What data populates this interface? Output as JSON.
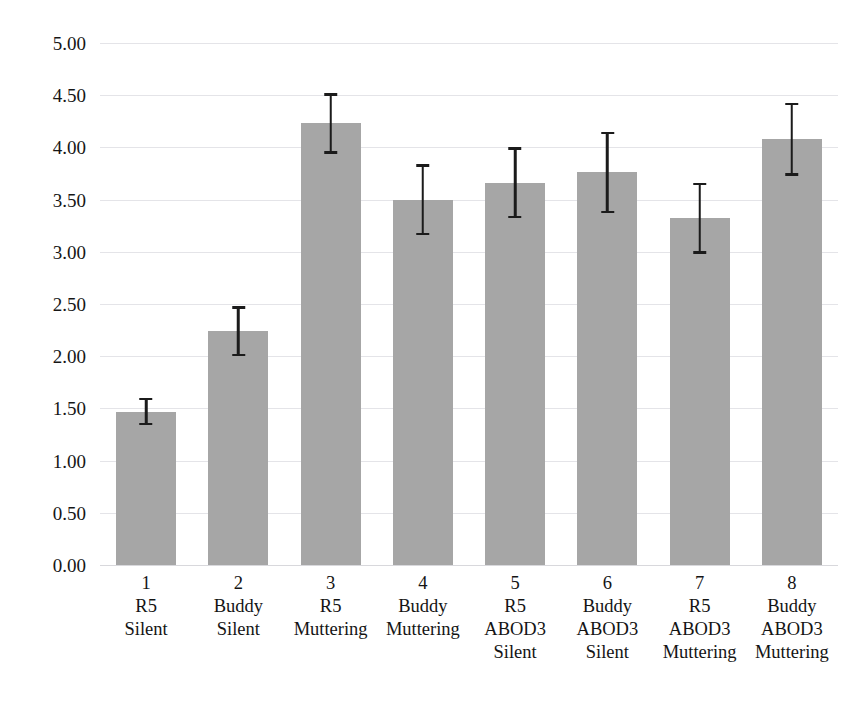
{
  "chart_data": {
    "type": "bar",
    "title": "",
    "subtitle": "",
    "xlabel": "",
    "ylabel": "",
    "ylim": [
      0,
      5
    ],
    "ytick_step": 0.5,
    "grid": true,
    "legend": "none",
    "orientation": "vertical",
    "error_bars": "symmetric",
    "ytick_labels": [
      "5.00",
      "4.50",
      "4.00",
      "3.50",
      "3.00",
      "2.50",
      "2.00",
      "1.50",
      "1.00",
      "0.50",
      "0.00"
    ],
    "ytick_values": [
      5.0,
      4.5,
      4.0,
      3.5,
      3.0,
      2.5,
      2.0,
      1.5,
      1.0,
      0.5,
      0.0
    ],
    "categories": [
      "1 R5 Silent",
      "2 Buddy Silent",
      "3 R5 Muttering",
      "4 Buddy Muttering",
      "5 R5 ABOD3 Silent",
      "6 Buddy ABOD3 Silent",
      "7 R5 ABOD3 Muttering",
      "8 Buddy ABOD3 Muttering"
    ],
    "category_lines": [
      [
        "1",
        "R5",
        "Silent"
      ],
      [
        "2",
        "Buddy",
        "Silent"
      ],
      [
        "3",
        "R5",
        "Muttering"
      ],
      [
        "4",
        "Buddy",
        "Muttering"
      ],
      [
        "5",
        "R5",
        "ABOD3",
        "Silent"
      ],
      [
        "6",
        "Buddy",
        "ABOD3",
        "Silent"
      ],
      [
        "7",
        "R5",
        "ABOD3",
        "Muttering"
      ],
      [
        "8",
        "Buddy",
        "ABOD3",
        "Muttering"
      ]
    ],
    "values": [
      1.47,
      2.24,
      4.23,
      3.5,
      3.66,
      3.76,
      3.32,
      4.08
    ],
    "errors": [
      0.13,
      0.24,
      0.29,
      0.34,
      0.34,
      0.39,
      0.34,
      0.35
    ],
    "bar_color": "#a6a6a6",
    "error_color": "#1b1b1b",
    "grid_color": "#e4e4e8",
    "background": "#ffffff"
  }
}
